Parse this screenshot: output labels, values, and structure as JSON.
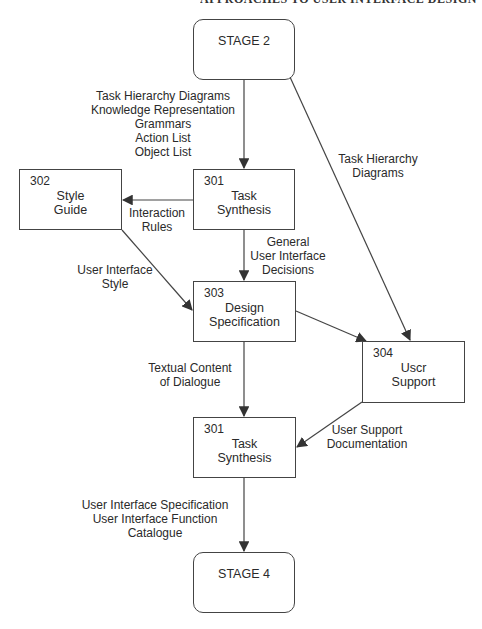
{
  "header": {
    "running_title": "APPROACHES TO USER INTERFACE DESIGN"
  },
  "nodes": {
    "stage2": {
      "title": "STAGE 2"
    },
    "task_synthesis_top": {
      "number": "301",
      "title_line1": "Task",
      "title_line2": "Synthesis"
    },
    "style_guide": {
      "number": "302",
      "title_line1": "Style",
      "title_line2": "Guide"
    },
    "design_spec": {
      "number": "303",
      "title_line1": "Design",
      "title_line2": "Specification"
    },
    "user_support": {
      "number": "304",
      "title_line1": "Uscr",
      "title_line2": "Support"
    },
    "task_synthesis_bottom": {
      "number": "301",
      "title_line1": "Task",
      "title_line2": "Synthesis"
    },
    "stage4": {
      "title": "STAGE 4"
    }
  },
  "edges": {
    "stage2_to_301": [
      "Task Hierarchy Diagrams",
      "Knowledge Representation",
      "Grammars",
      "Action List",
      "Object List"
    ],
    "stage2_to_304": [
      "Task Hierarchy",
      "Diagrams"
    ],
    "301_to_302": [
      "Interaction",
      "Rules"
    ],
    "301_to_303": [
      "General",
      "User Interface",
      "Decisions"
    ],
    "302_to_303": [
      "User Interface",
      "Style"
    ],
    "303_to_301b": [
      "Textual Content",
      "of Dialogue"
    ],
    "304_to_301b": [
      "User Support",
      "Documentation"
    ],
    "301b_to_stage4": [
      "User Interface Specification",
      "User Interface Function",
      "Catalogue"
    ]
  },
  "colors": {
    "stroke": "#444444",
    "text": "#2a2a2a",
    "background": "#ffffff"
  }
}
